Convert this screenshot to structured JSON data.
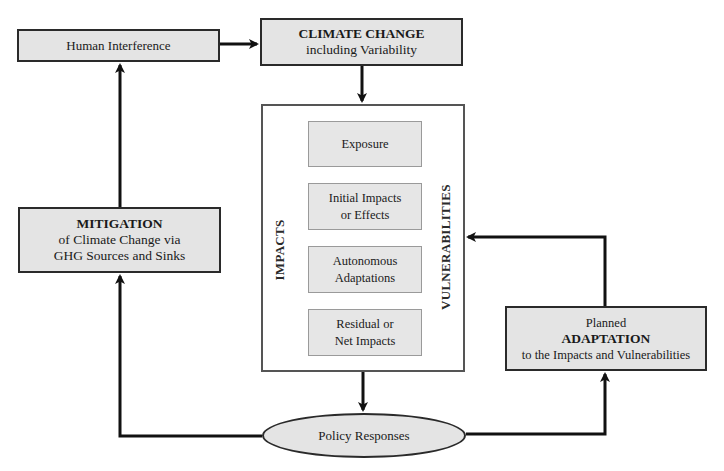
{
  "diagram": {
    "nodes": {
      "human_interference": {
        "label": "Human Interference"
      },
      "climate_change": {
        "title": "CLIMATE CHANGE",
        "subtitle": "including Variability"
      },
      "mitigation": {
        "title": "MITIGATION",
        "line2": "of Climate Change via",
        "line3": "GHG Sources and Sinks"
      },
      "adaptation": {
        "line1": "Planned",
        "title": "ADAPTATION",
        "line3": "to the Impacts and Vulnerabilities"
      },
      "policy_responses": {
        "label": "Policy Responses"
      }
    },
    "impacts_panel": {
      "left_label": "IMPACTS",
      "right_label": "VULNERABILITIES",
      "steps": [
        {
          "line1": "Exposure",
          "line2": ""
        },
        {
          "line1": "Initial Impacts",
          "line2": "or Effects"
        },
        {
          "line1": "Autonomous",
          "line2": "Adaptations"
        },
        {
          "line1": "Residual or",
          "line2": "Net Impacts"
        }
      ]
    },
    "edges": [
      {
        "from": "Human Interference",
        "to": "CLIMATE CHANGE"
      },
      {
        "from": "CLIMATE CHANGE",
        "to": "Impacts/Vulnerabilities panel"
      },
      {
        "from": "Exposure",
        "to": "Initial Impacts or Effects"
      },
      {
        "from": "Initial Impacts or Effects",
        "to": "Autonomous Adaptations"
      },
      {
        "from": "Autonomous Adaptations",
        "to": "Residual or Net Impacts"
      },
      {
        "from": "Impacts/Vulnerabilities panel",
        "to": "Policy Responses"
      },
      {
        "from": "Policy Responses",
        "to": "MITIGATION"
      },
      {
        "from": "MITIGATION",
        "to": "Human Interference"
      },
      {
        "from": "Policy Responses",
        "to": "ADAPTATION"
      },
      {
        "from": "ADAPTATION",
        "to": "Impacts/Vulnerabilities panel"
      }
    ]
  }
}
